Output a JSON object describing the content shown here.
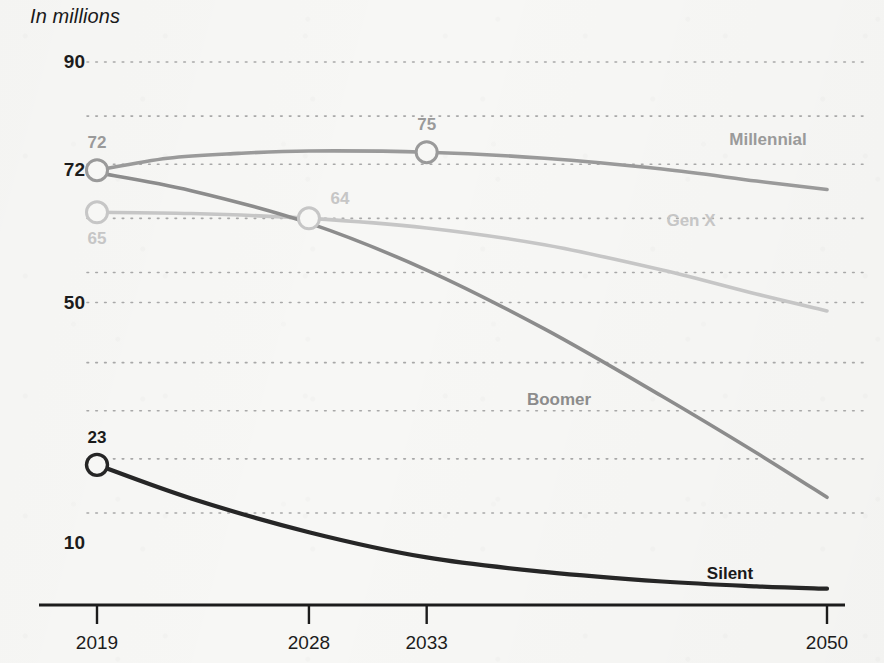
{
  "chart_data": {
    "type": "line",
    "title": "In millions",
    "xlabel": "",
    "ylabel": "",
    "grid": true,
    "legend_position": "inline-right",
    "x": [
      2019,
      2028,
      2033,
      2050
    ],
    "xlim": [
      2019,
      2050
    ],
    "ylim": [
      0,
      90
    ],
    "xticks": [
      "2019",
      "2028",
      "2033",
      "2050"
    ],
    "yticks": [
      "90",
      "72",
      "50",
      "10"
    ],
    "ytick_values": [
      90,
      72,
      50,
      10
    ],
    "gridline_values": [
      90,
      81,
      73,
      64,
      55,
      50,
      40,
      32,
      24,
      15
    ],
    "series": [
      {
        "name": "Millennial",
        "color": "#9a9a9a",
        "label_color": "#9a9a9a",
        "points": [
          {
            "x": 2019,
            "y": 72
          },
          {
            "x": 2022,
            "y": 74
          },
          {
            "x": 2025,
            "y": 74.8
          },
          {
            "x": 2028,
            "y": 75.2
          },
          {
            "x": 2033,
            "y": 75
          },
          {
            "x": 2038,
            "y": 74
          },
          {
            "x": 2043,
            "y": 72.2
          },
          {
            "x": 2047,
            "y": 70.2
          },
          {
            "x": 2050,
            "y": 68.8
          }
        ],
        "markers": [
          {
            "x": 2019,
            "y": 72,
            "label": "72",
            "label_pos": "above"
          },
          {
            "x": 2033,
            "y": 75,
            "label": "75",
            "label_pos": "above"
          }
        ]
      },
      {
        "name": "Gen X",
        "color": "#c6c6c6",
        "label_color": "#c6c6c6",
        "points": [
          {
            "x": 2019,
            "y": 65
          },
          {
            "x": 2023,
            "y": 64.8
          },
          {
            "x": 2028,
            "y": 64
          },
          {
            "x": 2033,
            "y": 62.4
          },
          {
            "x": 2038,
            "y": 59.6
          },
          {
            "x": 2043,
            "y": 55.4
          },
          {
            "x": 2047,
            "y": 51.4
          },
          {
            "x": 2050,
            "y": 48.6
          }
        ],
        "markers": [
          {
            "x": 2019,
            "y": 65,
            "label": "65",
            "label_pos": "below"
          },
          {
            "x": 2028,
            "y": 64,
            "label": "64",
            "label_pos": "above-right"
          }
        ]
      },
      {
        "name": "Boomer",
        "color": "#8c8c8c",
        "label_color": "#8c8c8c",
        "points": [
          {
            "x": 2019,
            "y": 71.6
          },
          {
            "x": 2023,
            "y": 68.6
          },
          {
            "x": 2028,
            "y": 63.2
          },
          {
            "x": 2033,
            "y": 55.4
          },
          {
            "x": 2038,
            "y": 45.6
          },
          {
            "x": 2043,
            "y": 34.4
          },
          {
            "x": 2047,
            "y": 25
          },
          {
            "x": 2050,
            "y": 17.6
          }
        ],
        "markers": []
      },
      {
        "name": "Silent",
        "color": "#262626",
        "label_color": "#1a1a1a",
        "points": [
          {
            "x": 2019,
            "y": 23
          },
          {
            "x": 2023,
            "y": 17.4
          },
          {
            "x": 2028,
            "y": 11.8
          },
          {
            "x": 2033,
            "y": 7.6
          },
          {
            "x": 2038,
            "y": 5.2
          },
          {
            "x": 2043,
            "y": 3.6
          },
          {
            "x": 2047,
            "y": 2.8
          },
          {
            "x": 2050,
            "y": 2.4
          }
        ],
        "markers": [
          {
            "x": 2019,
            "y": 23,
            "label": "23",
            "label_pos": "above"
          }
        ]
      }
    ],
    "series_label_positions": [
      {
        "name": "Millennial",
        "x": 768,
        "y": 140
      },
      {
        "name": "Gen X",
        "x": 691,
        "y": 221
      },
      {
        "name": "Boomer",
        "x": 559,
        "y": 400
      },
      {
        "name": "Silent",
        "x": 730,
        "y": 574
      }
    ]
  },
  "axis": {
    "axis_color": "#1c1c1c",
    "grid_color": "#a8a8a8"
  }
}
